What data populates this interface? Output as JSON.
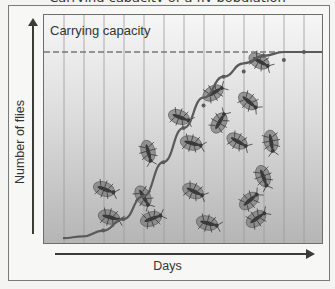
{
  "figure": {
    "title_partial": "Carrying capacity of a fly population",
    "carrying_capacity_label": "Carrying capacity",
    "y_axis_label": "Number of flies",
    "x_axis_label": "Days",
    "colors": {
      "curve": "#5a5a5a",
      "dashed_line": "#777777",
      "grid": "#9a9a9a",
      "fly_body": "#3a3a3a",
      "fly_wing": "#7d7d7d"
    },
    "grid_columns": 14,
    "flies": [
      {
        "x": 258,
        "y": 60,
        "angle": 30
      },
      {
        "x": 212,
        "y": 92,
        "angle": -30
      },
      {
        "x": 247,
        "y": 100,
        "angle": 40
      },
      {
        "x": 178,
        "y": 116,
        "angle": 20
      },
      {
        "x": 147,
        "y": 150,
        "angle": 75
      },
      {
        "x": 218,
        "y": 122,
        "angle": -60
      },
      {
        "x": 270,
        "y": 140,
        "angle": 80
      },
      {
        "x": 190,
        "y": 142,
        "angle": 15
      },
      {
        "x": 236,
        "y": 140,
        "angle": 30
      },
      {
        "x": 262,
        "y": 175,
        "angle": 70
      },
      {
        "x": 103,
        "y": 188,
        "angle": 20
      },
      {
        "x": 142,
        "y": 195,
        "angle": 60
      },
      {
        "x": 192,
        "y": 190,
        "angle": 25
      },
      {
        "x": 248,
        "y": 200,
        "angle": -40
      },
      {
        "x": 108,
        "y": 216,
        "angle": 15
      },
      {
        "x": 150,
        "y": 218,
        "angle": -20
      },
      {
        "x": 206,
        "y": 222,
        "angle": 15
      },
      {
        "x": 255,
        "y": 218,
        "angle": -35
      }
    ]
  },
  "chart_data": {
    "type": "line",
    "title": "Carrying capacity",
    "xlabel": "Days",
    "ylabel": "Number of flies",
    "grid": true,
    "series": [
      {
        "name": "Fly population (logistic growth)",
        "x": [
          1,
          2,
          3,
          4,
          5,
          6,
          7,
          8,
          9,
          10,
          11,
          12,
          13,
          14
        ],
        "values": [
          2,
          3,
          6,
          12,
          24,
          42,
          60,
          76,
          87,
          94,
          98,
          100,
          100,
          100
        ]
      }
    ],
    "annotations": [
      {
        "type": "hline",
        "label": "Carrying capacity",
        "value": 100,
        "style": "dashed"
      }
    ]
  }
}
